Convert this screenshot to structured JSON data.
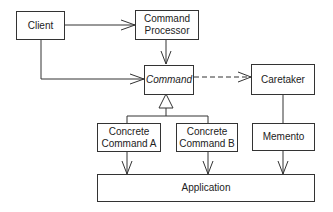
{
  "diagram": {
    "nodes": {
      "client": "Client",
      "command_processor_1": "Command",
      "command_processor_2": "Processor",
      "command": "Command",
      "caretaker": "Caretaker",
      "concrete_a_1": "Concrete",
      "concrete_a_2": "Command A",
      "concrete_b_1": "Concrete",
      "concrete_b_2": "Command B",
      "memento": "Memento",
      "application": "Application"
    },
    "edges": [
      {
        "from": "Client",
        "to": "Command Processor",
        "style": "solid-arrow"
      },
      {
        "from": "Client",
        "to": "Command",
        "style": "solid-arrow"
      },
      {
        "from": "Command Processor",
        "to": "Command",
        "style": "solid-arrow"
      },
      {
        "from": "Command",
        "to": "Caretaker",
        "style": "dashed-arrow"
      },
      {
        "from": "Concrete Command A",
        "to": "Command",
        "style": "inheritance"
      },
      {
        "from": "Concrete Command B",
        "to": "Command",
        "style": "inheritance"
      },
      {
        "from": "Caretaker",
        "to": "Memento",
        "style": "line"
      },
      {
        "from": "Concrete Command A",
        "to": "Application",
        "style": "solid-arrow"
      },
      {
        "from": "Concrete Command B",
        "to": "Application",
        "style": "solid-arrow"
      },
      {
        "from": "Memento",
        "to": "Application",
        "style": "solid-arrow"
      }
    ]
  }
}
